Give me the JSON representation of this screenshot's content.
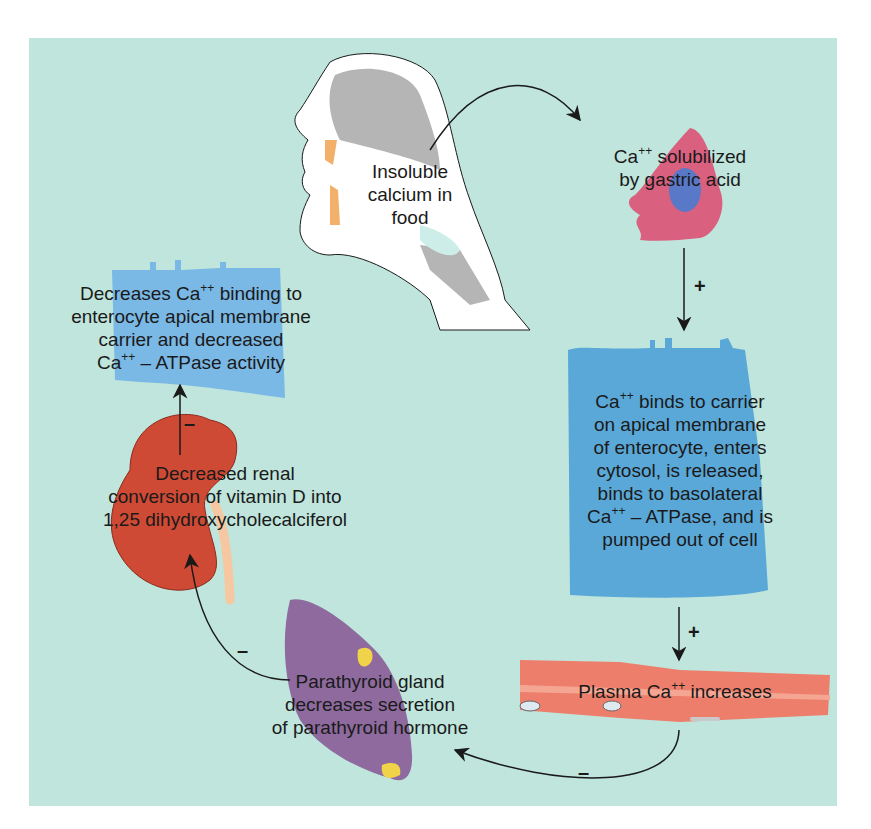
{
  "diagram": {
    "background_color": "#bfe5dc",
    "nodes": {
      "food": {
        "lines": [
          "Insoluble",
          "calcium in",
          "food"
        ]
      },
      "stomach": {
        "line1_pre": "Ca",
        "line1_sup": "++",
        "line1_post": " solubilized",
        "line2": "by gastric acid"
      },
      "enterocyte": {
        "l1_pre": "Ca",
        "l1_sup": "++",
        "l1_post": " binds to carrier",
        "l2": "on apical membrane",
        "l3": "of enterocyte, enters",
        "l4": "cytosol, is released,",
        "l5": "binds to basolateral",
        "l6_pre": "Ca",
        "l6_sup": "++",
        "l6_post": " – ATPase, and is",
        "l7": "pumped out of cell"
      },
      "plasma": {
        "pre": "Plasma Ca",
        "sup": "++",
        "post": " increases"
      },
      "parathyroid": {
        "lines": [
          "Parathyroid gland",
          "decreases secretion",
          "of parathyroid hormone"
        ]
      },
      "kidney": {
        "lines": [
          "Decreased renal",
          "conversion of vitamin D into",
          "1,25 dihydroxycholecalciferol"
        ]
      },
      "enterocyte_effect": {
        "l1_pre": "Decreases Ca",
        "l1_sup": "++",
        "l1_post": " binding to",
        "l2": "enterocyte apical membrane",
        "l3": "carrier and decreased",
        "l4_pre": "Ca",
        "l4_sup": "++",
        "l4_post": " – ATPase activity"
      }
    },
    "edges": [
      {
        "from": "food",
        "to": "stomach",
        "sign": ""
      },
      {
        "from": "stomach",
        "to": "enterocyte",
        "sign": "+"
      },
      {
        "from": "enterocyte",
        "to": "plasma",
        "sign": "+"
      },
      {
        "from": "plasma",
        "to": "parathyroid",
        "sign": "–"
      },
      {
        "from": "parathyroid",
        "to": "kidney",
        "sign": "–"
      },
      {
        "from": "kidney",
        "to": "enterocyte_effect",
        "sign": "–"
      }
    ],
    "colors": {
      "head_gray": "#b5b5b5",
      "teeth": "#f2b06b",
      "stomach_cell": "#d9607e",
      "nucleus": "#5a78c8",
      "enterocyte": "#5aa8d8",
      "enterocyte_light": "#7ab8e6",
      "vessel": "#ee7e6c",
      "kidney": "#cf4a35",
      "ureter": "#f6c7a0",
      "parathyroid": "#8e6a9e",
      "parathyroid_gland": "#f1d34a"
    }
  }
}
